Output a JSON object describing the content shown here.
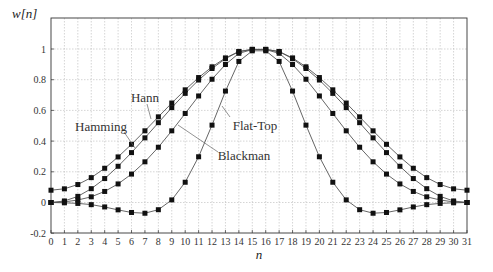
{
  "chart_data": {
    "type": "line",
    "title": "",
    "xlabel": "n",
    "ylabel": "w[n]",
    "xlim": [
      0,
      31
    ],
    "ylim": [
      -0.2,
      1.2
    ],
    "grid": true,
    "legend": "inline labels",
    "x": [
      0,
      1,
      2,
      3,
      4,
      5,
      6,
      7,
      8,
      9,
      10,
      11,
      12,
      13,
      14,
      15,
      16,
      17,
      18,
      19,
      20,
      21,
      22,
      23,
      24,
      25,
      26,
      27,
      28,
      29,
      30,
      31
    ],
    "x_ticks": [
      "0",
      "1",
      "2",
      "3",
      "4",
      "5",
      "6",
      "7",
      "8",
      "9",
      "10",
      "11",
      "12",
      "13",
      "14",
      "15",
      "16",
      "17",
      "18",
      "19",
      "20",
      "21",
      "22",
      "23",
      "24",
      "25",
      "26",
      "27",
      "28",
      "29",
      "30",
      "31"
    ],
    "y_ticks": [
      {
        "value": 1,
        "label": "1"
      },
      {
        "value": 0.8,
        "label": "0.8"
      },
      {
        "value": 0.6,
        "label": "0.6"
      },
      {
        "value": 0.4,
        "label": "0.4"
      },
      {
        "value": 0.2,
        "label": "0.2"
      },
      {
        "value": 0,
        "label": "0"
      },
      {
        "value": -0.2,
        "label": "-0.2"
      }
    ],
    "series": [
      {
        "name": "Hann",
        "values": [
          0.0,
          0.01,
          0.04,
          0.09,
          0.156,
          0.236,
          0.325,
          0.421,
          0.52,
          0.618,
          0.711,
          0.798,
          0.873,
          0.937,
          0.983,
          0.997,
          0.997,
          0.983,
          0.937,
          0.873,
          0.798,
          0.711,
          0.618,
          0.52,
          0.421,
          0.325,
          0.236,
          0.156,
          0.09,
          0.04,
          0.01,
          0.0
        ]
      },
      {
        "name": "Hamming",
        "values": [
          0.08,
          0.089,
          0.117,
          0.162,
          0.223,
          0.297,
          0.379,
          0.467,
          0.558,
          0.648,
          0.734,
          0.814,
          0.884,
          0.942,
          0.984,
          0.998,
          0.998,
          0.984,
          0.942,
          0.884,
          0.814,
          0.734,
          0.648,
          0.558,
          0.467,
          0.379,
          0.297,
          0.223,
          0.162,
          0.117,
          0.089,
          0.08
        ]
      },
      {
        "name": "Blackman",
        "values": [
          0.0,
          0.004,
          0.016,
          0.037,
          0.072,
          0.121,
          0.185,
          0.265,
          0.36,
          0.467,
          0.58,
          0.694,
          0.803,
          0.899,
          0.972,
          0.996,
          0.996,
          0.972,
          0.899,
          0.803,
          0.694,
          0.58,
          0.467,
          0.36,
          0.265,
          0.185,
          0.121,
          0.072,
          0.037,
          0.016,
          0.004,
          0.0
        ]
      },
      {
        "name": "Flat-Top",
        "values": [
          0.0,
          -0.002,
          -0.006,
          -0.014,
          -0.029,
          -0.048,
          -0.065,
          -0.07,
          -0.047,
          0.017,
          0.132,
          0.298,
          0.504,
          0.726,
          0.919,
          0.988,
          0.988,
          0.919,
          0.726,
          0.504,
          0.298,
          0.132,
          0.017,
          -0.047,
          -0.07,
          -0.065,
          -0.048,
          -0.029,
          -0.014,
          -0.006,
          -0.002,
          0.0
        ]
      }
    ],
    "annotations": [
      {
        "text": "Hann",
        "x": 145,
        "y": 102,
        "line": [
          147,
          104,
          151,
          119
        ]
      },
      {
        "text": "Hamming",
        "x": 101,
        "y": 131,
        "line": [
          124,
          132,
          135,
          148
        ]
      },
      {
        "text": "Flat-Top",
        "x": 255,
        "y": 130,
        "line": [
          230,
          117,
          222,
          106
        ]
      },
      {
        "text": "Blackman",
        "x": 244,
        "y": 160,
        "line": [
          218,
          152,
          178,
          125
        ]
      }
    ]
  },
  "layout": {
    "plot_left": 51,
    "plot_right": 467,
    "plot_top": 18,
    "plot_bottom": 233,
    "line_color": "#555555",
    "marker_color": "#111111",
    "grid_color": "#b8b8b8",
    "axis_color": "#333333"
  }
}
